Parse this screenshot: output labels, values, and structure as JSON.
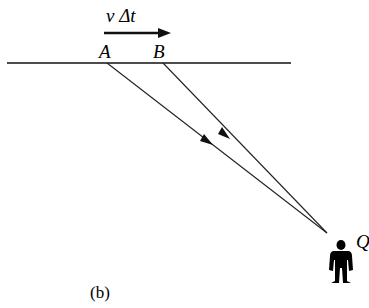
{
  "diagram": {
    "labels": {
      "velocity_displacement": "v Δt",
      "point_a": "A",
      "point_b": "B",
      "observer": "Q",
      "panel": "(b)"
    },
    "colors": {
      "line": "#111111",
      "background": "#ffffff"
    },
    "elements": {
      "baseline": {
        "x1": 7,
        "y1": 63,
        "x2": 291,
        "y2": 63
      },
      "motion_arrow": {
        "x1": 104,
        "y1": 33,
        "x2": 170,
        "y2": 33
      },
      "ray_from_a": {
        "x1": 107,
        "y1": 63,
        "x2": 327,
        "y2": 233
      },
      "ray_from_b": {
        "x1": 163,
        "y1": 63,
        "x2": 327,
        "y2": 233
      },
      "observer_icon": "person-icon"
    }
  }
}
